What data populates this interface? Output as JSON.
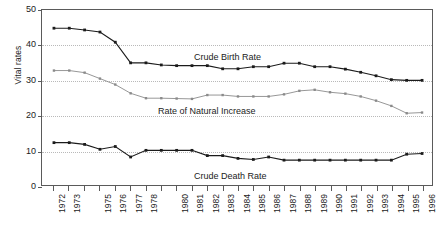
{
  "chart_data": {
    "type": "line",
    "title": "",
    "xlabel": "",
    "ylabel": "Vital rates",
    "ylim": [
      0,
      50
    ],
    "yticks": [
      0,
      10,
      20,
      30,
      40,
      50
    ],
    "grid": true,
    "legend_position": "inline-annotations",
    "x": [
      1972,
      1973,
      1974,
      1975,
      1976,
      1977,
      1978,
      1979,
      1980,
      1981,
      1982,
      1983,
      1984,
      1985,
      1986,
      1987,
      1988,
      1989,
      1990,
      1991,
      1992,
      1993,
      1994,
      1995,
      1996
    ],
    "xtick_labels": [
      "1972",
      "1973",
      "",
      "1975",
      "1976",
      "1977",
      "1978",
      "",
      "1980",
      "1981",
      "1982",
      "1983",
      "1984",
      "1985",
      "1986",
      "1987",
      "1988",
      "1989",
      "1990",
      "1991",
      "1992",
      "1993",
      "1994",
      "1995",
      "1996"
    ],
    "series": [
      {
        "name": "Crude Birth Rate",
        "color": "#1b1b1b",
        "values": [
          44.8,
          44.8,
          44.3,
          43.7,
          40.8,
          34.9,
          34.9,
          34.3,
          34.1,
          34.1,
          34.1,
          33.2,
          33.2,
          33.8,
          33.8,
          34.8,
          34.8,
          33.8,
          33.8,
          33.1,
          32.2,
          31.2,
          30.1,
          29.9,
          29.9
        ]
      },
      {
        "name": "Rate of Natural Increase",
        "color": "#8a8a8a",
        "values": [
          32.7,
          32.7,
          32.1,
          30.4,
          28.7,
          26.2,
          24.8,
          24.8,
          24.7,
          24.6,
          25.7,
          25.7,
          25.3,
          25.3,
          25.3,
          25.9,
          26.9,
          27.2,
          26.5,
          26.1,
          25.3,
          24.1,
          22.6,
          20.5,
          20.7
        ]
      },
      {
        "name": "Crude Death Rate",
        "color": "#1b1b1b",
        "values": [
          12.1,
          12.1,
          11.6,
          10.2,
          11.0,
          8.0,
          9.9,
          9.9,
          9.9,
          9.9,
          8.4,
          8.4,
          7.6,
          7.3,
          8.0,
          7.1,
          7.1,
          7.1,
          7.1,
          7.1,
          7.1,
          7.1,
          7.1,
          8.8,
          9.0
        ]
      }
    ],
    "annotations": [
      {
        "name": "Crude Birth Rate"
      },
      {
        "name": "Rate of Natural Increase"
      },
      {
        "name": "Crude Death Rate"
      }
    ]
  }
}
